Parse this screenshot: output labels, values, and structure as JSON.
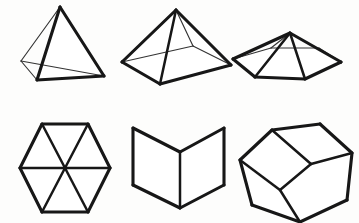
{
  "figure": {
    "background_color": "#fdfdfc",
    "stroke_color": "#171717",
    "canvas": {
      "width": 359,
      "height": 223
    },
    "shape_count": 6,
    "style": "black line drawing on white, no labels or text"
  },
  "shapes": [
    {
      "id": "tetrahedron",
      "name": "Tetrahedron",
      "row": 1,
      "column": 1,
      "faces": 4,
      "vertices": 4,
      "edges": 6,
      "vertex_points": [
        {
          "label": "apex",
          "x": 60,
          "y": 7
        },
        {
          "label": "front-bottom",
          "x": 37,
          "y": 80
        },
        {
          "label": "right",
          "x": 104,
          "y": 76
        },
        {
          "label": "back-left",
          "x": 21,
          "y": 61
        }
      ],
      "outline_path": "M 60 7 L 37 80 L 104 76 Z",
      "back_edges": [
        {
          "from": "apex",
          "to": "back-left"
        },
        {
          "from": "back-left",
          "to": "front-bottom"
        },
        {
          "from": "back-left",
          "to": "right"
        }
      ]
    },
    {
      "id": "square-pyramid",
      "name": "Square Pyramid",
      "row": 1,
      "column": 2,
      "faces": 5,
      "vertices": 5,
      "edges": 8,
      "vertex_points": [
        {
          "label": "apex",
          "x": 176,
          "y": 10
        },
        {
          "label": "base-left",
          "x": 122,
          "y": 62
        },
        {
          "label": "base-front",
          "x": 160,
          "y": 84
        },
        {
          "label": "base-right",
          "x": 231,
          "y": 65
        },
        {
          "label": "base-back",
          "x": 193,
          "y": 46
        }
      ],
      "outline_path": "M 176 10 L 122 62 L 160 84 L 231 65 Z",
      "back_edges": [
        {
          "from": "apex",
          "to": "base-back"
        },
        {
          "from": "base-left",
          "to": "base-back"
        },
        {
          "from": "base-back",
          "to": "base-right"
        }
      ]
    },
    {
      "id": "hexagonal-pyramid",
      "name": "Hexagonal Pyramid",
      "row": 1,
      "column": 3,
      "faces": 7,
      "vertices": 7,
      "edges": 12,
      "vertex_points": [
        {
          "label": "apex",
          "x": 290,
          "y": 33
        },
        {
          "label": "b1",
          "x": 233,
          "y": 59
        },
        {
          "label": "b2",
          "x": 255,
          "y": 77
        },
        {
          "label": "b3",
          "x": 305,
          "y": 79
        },
        {
          "label": "b4",
          "x": 341,
          "y": 62
        },
        {
          "label": "b5",
          "x": 319,
          "y": 48
        },
        {
          "label": "b6",
          "x": 271,
          "y": 48
        }
      ],
      "outline_path": "M 233 59 L 255 77 L 305 79 L 341 62 L 319 48 L 271 48 Z",
      "back_edges": [
        {
          "from": "apex",
          "to": "b6"
        },
        {
          "from": "apex",
          "to": "b5"
        },
        {
          "from": "b1",
          "to": "b6"
        },
        {
          "from": "b6",
          "to": "b5"
        },
        {
          "from": "b5",
          "to": "b4"
        }
      ]
    },
    {
      "id": "hexagon-six-triangles",
      "name": "Regular Hexagon Divided Into Six Triangles",
      "row": 2,
      "column": 1,
      "faces": 6,
      "vertices": 7,
      "edges": 12,
      "vertex_points": [
        {
          "label": "top-left",
          "x": 42,
          "y": 124
        },
        {
          "label": "top-right",
          "x": 88,
          "y": 124
        },
        {
          "label": "right",
          "x": 110,
          "y": 168
        },
        {
          "label": "bottom-right",
          "x": 88,
          "y": 212
        },
        {
          "label": "bottom-left",
          "x": 42,
          "y": 212
        },
        {
          "label": "left",
          "x": 20,
          "y": 168
        },
        {
          "label": "center",
          "x": 65,
          "y": 168
        }
      ],
      "outline_path": "M 42 124 L 88 124 L 110 168 L 88 212 L 42 212 L 20 168 Z",
      "internal_spokes": [
        "top-left",
        "top-right",
        "right",
        "bottom-right",
        "bottom-left",
        "left"
      ]
    },
    {
      "id": "open-corner-box",
      "name": "Open Box Corner (Three Perpendicular Faces)",
      "row": 2,
      "column": 2,
      "faces": 3,
      "vertices": 8,
      "edges": 9,
      "vertex_points": [
        {
          "label": "left-top-outer",
          "x": 133,
          "y": 128
        },
        {
          "label": "left-top-inner",
          "x": 180,
          "y": 152
        },
        {
          "label": "right-top-inner",
          "x": 180,
          "y": 152
        },
        {
          "label": "right-top-outer",
          "x": 224,
          "y": 128
        },
        {
          "label": "left-bottom-outer",
          "x": 133,
          "y": 185
        },
        {
          "label": "center-vertical",
          "x": 180,
          "y": 208
        },
        {
          "label": "right-bottom-outer",
          "x": 224,
          "y": 185
        },
        {
          "label": "floor-front",
          "x": 180,
          "y": 208
        }
      ],
      "back_edges": [
        {
          "from": "left-bottom-outer",
          "to": "center-vertical"
        },
        {
          "from": "center-vertical",
          "to": "right-bottom-outer"
        }
      ]
    },
    {
      "id": "dodecahedron",
      "name": "Dodecahedron (Pentagonal Faces)",
      "row": 2,
      "column": 3,
      "faces": 12,
      "vertices": 20,
      "edges": 30,
      "visible_faces": 3,
      "vertex_points": [
        {
          "label": "p1",
          "x": 272,
          "y": 130
        },
        {
          "label": "p2",
          "x": 320,
          "y": 124
        },
        {
          "label": "p3",
          "x": 352,
          "y": 153
        },
        {
          "label": "p4",
          "x": 347,
          "y": 200
        },
        {
          "label": "p5",
          "x": 300,
          "y": 222
        },
        {
          "label": "p6",
          "x": 252,
          "y": 205
        },
        {
          "label": "p7",
          "x": 240,
          "y": 160
        },
        {
          "label": "p8",
          "x": 311,
          "y": 164
        },
        {
          "label": "p9",
          "x": 280,
          "y": 190
        }
      ],
      "outline_path": "M 272 130 L 320 124 L 352 153 L 347 200 L 300 222 L 252 205 L 240 160 Z"
    }
  ]
}
